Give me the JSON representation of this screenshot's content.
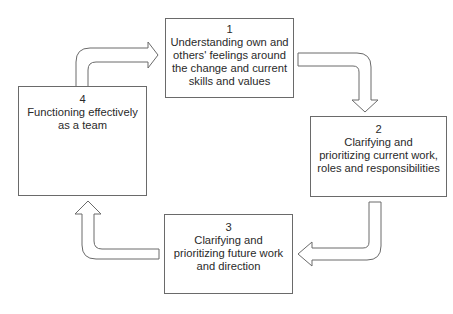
{
  "diagram": {
    "type": "cycle",
    "steps": [
      {
        "number": "1",
        "lines": [
          "Understanding own and",
          "others' feelings around",
          "the change and current",
          "skills and values"
        ]
      },
      {
        "number": "2",
        "lines": [
          "Clarifying and",
          "prioritizing current work,",
          "roles and responsibilities"
        ]
      },
      {
        "number": "3",
        "lines": [
          "Clarifying and",
          "prioritizing future work",
          "and direction"
        ]
      },
      {
        "number": "4",
        "lines": [
          "Functioning effectively",
          "as a team"
        ]
      }
    ],
    "flow": [
      "1 -> 2",
      "2 -> 3",
      "3 -> 4",
      "4 -> 1"
    ],
    "colors": {
      "stroke": "#6a6a6a",
      "fill": "#ffffff",
      "text": "#2a2a2a"
    }
  }
}
